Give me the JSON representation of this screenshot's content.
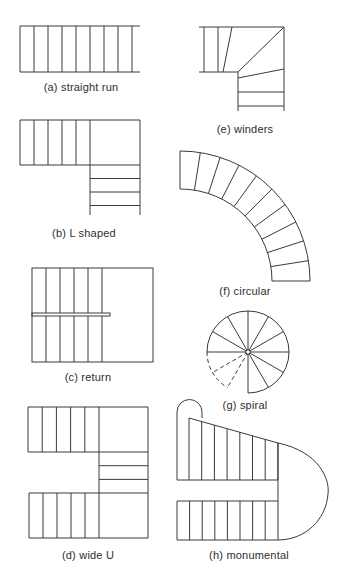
{
  "figure": {
    "panels": [
      {
        "id": "a",
        "label": "(a) straight run",
        "type": "straight-run",
        "treads": 8
      },
      {
        "id": "b",
        "label": "(b) L shaped",
        "type": "l-shaped",
        "treads_first_flight": 5,
        "treads_second_flight": 3
      },
      {
        "id": "c",
        "label": "(c) return",
        "type": "return",
        "treads_per_flight": 5
      },
      {
        "id": "d",
        "label": "(d) wide U",
        "type": "wide-u",
        "treads_top_flight": 5,
        "treads_middle_flight": 3,
        "treads_bottom_flight": 5
      },
      {
        "id": "e",
        "label": "(e) winders",
        "type": "winders",
        "treads_straight": 3,
        "winder_treads": 3,
        "treads_lower": 2
      },
      {
        "id": "f",
        "label": "(f) circular",
        "type": "circular",
        "treads": 10
      },
      {
        "id": "g",
        "label": "(g) spiral",
        "type": "spiral",
        "treads": 10,
        "hidden_treads": 2
      },
      {
        "id": "h",
        "label": "(h) monumental",
        "type": "monumental",
        "treads_top_flight": 7,
        "treads_bottom_flight": 8
      }
    ],
    "line_color": "#3a3a3a",
    "text_color": "#2e2e2e",
    "background": "#ffffff"
  }
}
